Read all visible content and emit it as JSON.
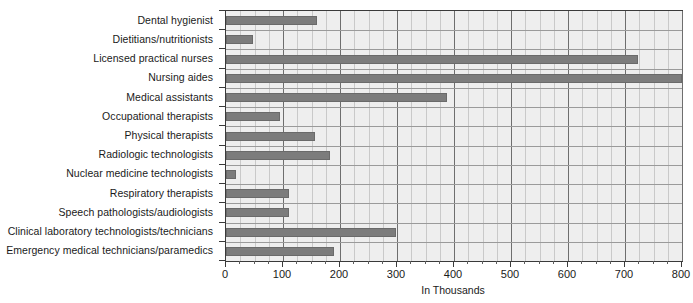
{
  "chart_data": {
    "type": "bar",
    "orientation": "horizontal",
    "title": "",
    "xlabel": "In Thousands",
    "ylabel": "",
    "xlim": [
      0,
      800
    ],
    "xticks": [
      0,
      100,
      200,
      300,
      400,
      500,
      600,
      700,
      800
    ],
    "xtick_labels": [
      "0",
      "100",
      "200",
      "300",
      "400",
      "500",
      "600",
      "700",
      "800"
    ],
    "minor_tick_step": 25,
    "grid": true,
    "legend": false,
    "bar_color": "#7c7c7c",
    "plot_background": "#eeeeee",
    "categories": [
      "Dental hygienist",
      "Dietitians/nutritionists",
      "Licensed practical nurses",
      "Nursing aides",
      "Medical assistants",
      "Occupational therapists",
      "Physical therapists",
      "Radiologic technologists",
      "Nuclear medicine technologists",
      "Respiratory therapists",
      "Speech pathologists/audiologists",
      "Clinical laboratory technologists/technicians",
      "Emergency medical technicians/paramedics"
    ],
    "values": [
      160,
      48,
      722,
      800,
      387,
      95,
      157,
      182,
      17,
      110,
      110,
      298,
      190
    ]
  },
  "axis": {
    "x_label": "In Thousands"
  }
}
